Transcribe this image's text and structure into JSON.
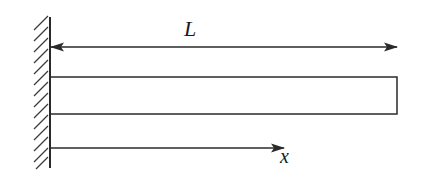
{
  "diagram": {
    "title": "",
    "labels": {
      "length": "L",
      "axis": "x"
    },
    "elements": {
      "wall": {
        "type": "fixed-support",
        "side": "left",
        "hatched": true
      },
      "beam": {
        "type": "rectangle",
        "shape": "cantilever-beam"
      },
      "length_dimension": {
        "type": "double-arrow",
        "label": "L"
      },
      "x_axis": {
        "type": "arrow",
        "direction": "right",
        "label": "x"
      }
    },
    "colors": {
      "stroke": "#2a2a2a",
      "background": "#ffffff"
    }
  }
}
